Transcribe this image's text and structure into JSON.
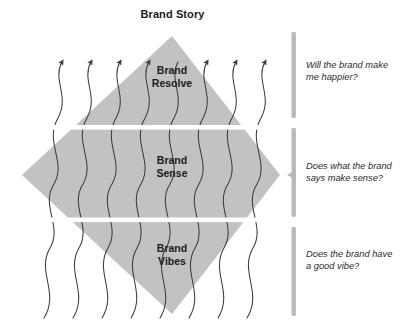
{
  "diagram": {
    "title": "Brand Story",
    "type": "layered-diamond",
    "accent_color": "#b9b9b9",
    "band_fill_color": "#c2c2c2",
    "line_color": "#3c3c3c",
    "text_color": "#1b1b1b",
    "bands": [
      {
        "id": "resolve",
        "label": "Brand\nResolve",
        "question": "Will the brand make\nme happier?"
      },
      {
        "id": "sense",
        "label": "Brand\nSense",
        "question": "Does what the brand\nsays make sense?"
      },
      {
        "id": "vibes",
        "label": "Brand\nVibes",
        "question": "Does the brand have\na good vibe?"
      }
    ]
  }
}
